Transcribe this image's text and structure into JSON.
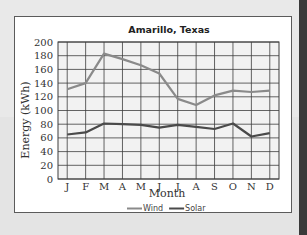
{
  "chart_data": {
    "type": "line",
    "title": "Amarillo, Texas",
    "xlabel": "Month",
    "ylabel": "Energy (kWh)",
    "categories": [
      "J",
      "F",
      "M",
      "A",
      "M",
      "J",
      "J",
      "A",
      "S",
      "O",
      "N",
      "D"
    ],
    "series": [
      {
        "name": "Wind",
        "color": "#8a8a8a",
        "values": [
          131,
          140,
          183,
          175,
          166,
          154,
          117,
          108,
          122,
          129,
          127,
          129
        ]
      },
      {
        "name": "Solar",
        "color": "#4a4a4a",
        "values": [
          65,
          68,
          81,
          80,
          79,
          75,
          79,
          76,
          73,
          81,
          62,
          67
        ]
      }
    ],
    "ylim": [
      0,
      200
    ],
    "yticks": [
      0,
      20,
      40,
      60,
      80,
      100,
      120,
      140,
      160,
      180,
      200
    ],
    "grid": true,
    "legend_position": "bottom"
  },
  "colors": {
    "plot_background": "#f2f2f2",
    "grid": "#3d3d3d",
    "frame": "#5b5b5b",
    "page_background": "#e9e9e9"
  }
}
